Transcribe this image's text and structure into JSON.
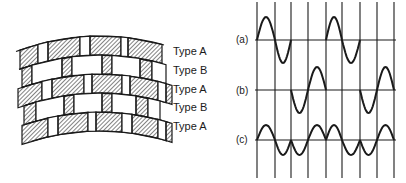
{
  "left_diagram": {
    "description": "Curved brick courses with alternating hatched and plain blocks",
    "rows": [
      {
        "label": "Type A",
        "y": 51
      },
      {
        "label": "Type B",
        "y": 70
      },
      {
        "label": "Type A",
        "y": 89
      },
      {
        "label": "Type B",
        "y": 107
      },
      {
        "label": "Type A",
        "y": 126
      }
    ],
    "colors": {
      "stroke": "#1a1a1a",
      "fill": "#ffffff"
    }
  },
  "right_diagram": {
    "description": "Three waveform traces with vertical time markers",
    "traces": [
      {
        "label": "(a)",
        "baseline_y": 40
      },
      {
        "label": "(b)",
        "baseline_y": 90
      },
      {
        "label": "(c)",
        "baseline_y": 140
      }
    ],
    "vertical_lines_x": [
      257,
      275,
      291,
      308,
      326,
      342,
      360,
      377,
      394
    ]
  }
}
